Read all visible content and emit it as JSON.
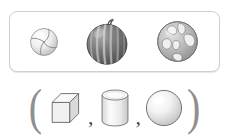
{
  "panel": {
    "label": "real-world round objects",
    "objects": [
      {
        "name": "ball",
        "label": "ball",
        "icon": "ball-icon",
        "size": 29
      },
      {
        "name": "watermelon",
        "label": "watermelon",
        "icon": "watermelon-icon",
        "size": 45
      },
      {
        "name": "globe",
        "label": "globe",
        "icon": "globe-icon",
        "size": 44
      }
    ]
  },
  "answer": {
    "open_paren": "(",
    "close_paren": ")",
    "separator": ",",
    "shapes": [
      {
        "name": "cube",
        "label": "cube",
        "icon": "cube-icon"
      },
      {
        "name": "cylinder",
        "label": "cylinder",
        "icon": "cylinder-icon"
      },
      {
        "name": "sphere",
        "label": "sphere",
        "icon": "sphere-icon"
      }
    ]
  },
  "colors": {
    "panel_border": "#cfcfcf",
    "paren": "#8f8f8f",
    "comma": "#4a4a4a",
    "outline": "#6e6e6e",
    "shape_fill_light": "#f2f2f2",
    "shape_fill_mid": "#dcdcdc",
    "shape_fill_dark": "#bdbdbd",
    "melon_dark": "#6b6b6b",
    "melon_light": "#a8a8a8",
    "globe_land": "#ededed",
    "globe_sea": "#9e9e9e",
    "background": "#ffffff"
  }
}
